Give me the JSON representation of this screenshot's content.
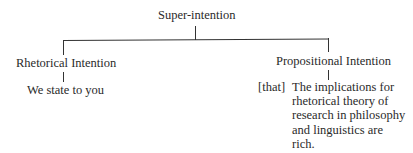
{
  "diagram": {
    "root": {
      "label": "Super-intention"
    },
    "children": [
      {
        "label": "Rhetorical Intention",
        "child": {
          "prefix": "",
          "lines": [
            "We state to you"
          ]
        }
      },
      {
        "label": "Propositional Intention",
        "child": {
          "prefix": "[that]",
          "lines": [
            "The implications for",
            "rhetorical theory of",
            "research in philosophy",
            "and linguistics are",
            "rich."
          ]
        }
      }
    ]
  }
}
